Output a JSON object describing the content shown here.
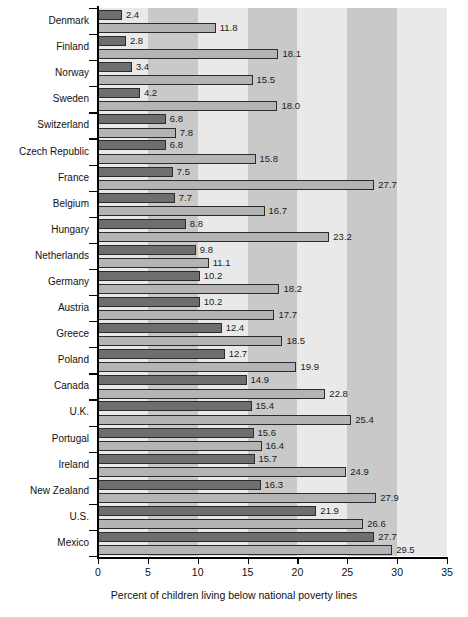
{
  "chart_data": {
    "type": "bar",
    "orientation": "horizontal",
    "title": "",
    "xlabel": "Percent of children living below national poverty lines",
    "ylabel": "",
    "xlim": [
      0,
      35
    ],
    "xticks": [
      0,
      5,
      10,
      15,
      20,
      25,
      30,
      35
    ],
    "grid": false,
    "legend": "none",
    "categories": [
      "Denmark",
      "Finland",
      "Norway",
      "Sweden",
      "Switzerland",
      "Czech Republic",
      "France",
      "Belgium",
      "Hungary",
      "Netherlands",
      "Germany",
      "Austria",
      "Greece",
      "Poland",
      "Canada",
      "U.K.",
      "Portugal",
      "Ireland",
      "New Zealand",
      "U.S.",
      "Mexico"
    ],
    "series": [
      {
        "name": "series-dark",
        "color": "#6e6e6e",
        "values": [
          2.4,
          2.8,
          3.4,
          4.2,
          6.8,
          6.8,
          7.5,
          7.7,
          8.8,
          9.8,
          10.2,
          10.2,
          12.4,
          12.7,
          14.9,
          15.4,
          15.6,
          15.7,
          16.3,
          21.9,
          27.7
        ]
      },
      {
        "name": "series-light",
        "color": "#b4b4b4",
        "values": [
          11.8,
          18.1,
          15.5,
          18.0,
          7.8,
          15.8,
          27.7,
          16.7,
          23.2,
          11.1,
          18.2,
          17.7,
          18.5,
          19.9,
          22.8,
          25.4,
          16.4,
          24.9,
          27.9,
          26.6,
          29.5
        ]
      }
    ],
    "value_labels_dark": [
      "2.4",
      "2.8",
      "3.4",
      "4.2",
      "6.8",
      "6.8",
      "7.5",
      "7.7",
      "8.8",
      "9.8",
      "10.2",
      "10.2",
      "12.4",
      "12.7",
      "14.9",
      "15.4",
      "15.6",
      "15.7",
      "16.3",
      "21.9",
      "27.7"
    ],
    "value_labels_light": [
      "11.8",
      "18.1",
      "15.5",
      "18.0",
      "7.8",
      "15.8",
      "27.7",
      "16.7",
      "23.2",
      "11.1",
      "18.2",
      "17.7",
      "18.5",
      "19.9",
      "22.8",
      "25.4",
      "16.4",
      "24.9",
      "27.9",
      "26.6",
      "29.5"
    ],
    "band_colors": [
      "#e9e9e9",
      "#c9c9c9"
    ],
    "background": "#ffffff",
    "bar_border_color": "#2b2b2b"
  }
}
